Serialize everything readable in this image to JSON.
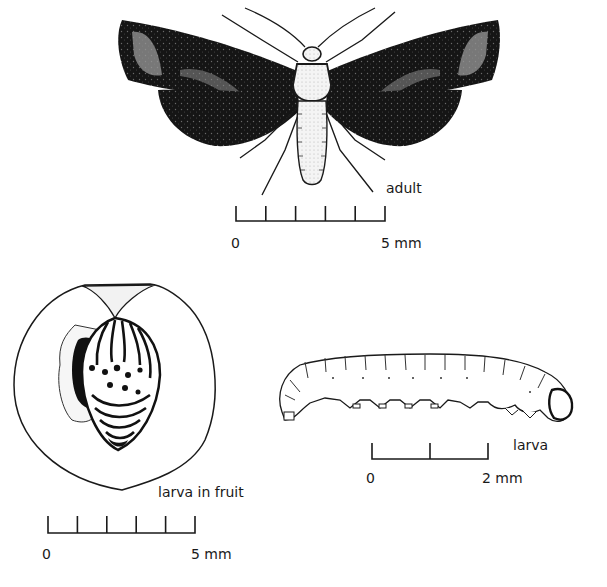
{
  "figure": {
    "panels": [
      {
        "id": "adult",
        "subject": "adult moth, dorsal view with wings spread",
        "label": "adult",
        "scale_bar": {
          "start_label": "0",
          "end_label": "5 mm",
          "length_mm": 5,
          "divisions": 5
        }
      },
      {
        "id": "larva-in-fruit",
        "subject": "larva curled inside cut-open fruit",
        "label": "larva in fruit",
        "scale_bar": {
          "start_label": "0",
          "end_label": "5 mm",
          "length_mm": 5,
          "divisions": 5
        }
      },
      {
        "id": "larva",
        "subject": "larva, lateral view",
        "label": "larva",
        "scale_bar": {
          "start_label": "0",
          "end_label": "2 mm",
          "length_mm": 2,
          "divisions": 2
        }
      }
    ]
  },
  "colors": {
    "ink": "#1a1a1a",
    "wing_dark": "#161616",
    "wing_light": "#8a8a8a",
    "paper": "#ffffff"
  }
}
